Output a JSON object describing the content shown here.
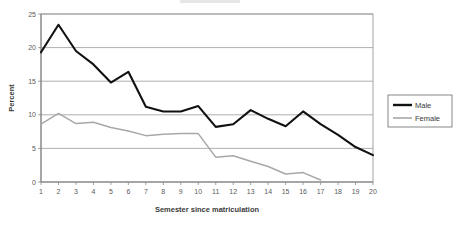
{
  "chart_data": {
    "type": "line",
    "title": "",
    "subtitle": "",
    "xlabel": "Semester since matriculation",
    "ylabel": "Percent",
    "x": [
      1,
      2,
      3,
      4,
      5,
      6,
      7,
      8,
      9,
      10,
      11,
      12,
      13,
      14,
      15,
      16,
      17,
      18,
      19,
      20
    ],
    "xticklabels": [
      "1",
      "2",
      "3",
      "4",
      "5",
      "6",
      "7",
      "8",
      "9",
      "10",
      "11",
      "12",
      "13",
      "14",
      "15",
      "16",
      "17",
      "18",
      "19",
      "20"
    ],
    "yticklabels": [
      "0",
      "5",
      "10",
      "15",
      "20",
      "25"
    ],
    "yticks": [
      0,
      5,
      10,
      15,
      20,
      25
    ],
    "ylim": [
      0,
      25
    ],
    "xlim": [
      1,
      20
    ],
    "grid": "horizontal",
    "legend_position": "right-outside",
    "series": [
      {
        "name": "Male",
        "color": "#111111",
        "values": [
          19.3,
          23.4,
          19.5,
          17.5,
          14.8,
          16.4,
          11.2,
          10.5,
          10.5,
          11.3,
          8.2,
          8.6,
          10.7,
          9.4,
          8.3,
          10.5,
          8.6,
          7.0,
          5.2,
          4.0
        ]
      },
      {
        "name": "Female",
        "color": "#a8a8a8",
        "values": [
          8.6,
          10.2,
          8.7,
          8.9,
          8.1,
          7.6,
          6.9,
          7.1,
          7.2,
          7.2,
          3.7,
          3.9,
          3.1,
          2.3,
          1.2,
          1.4,
          0.3,
          null,
          null,
          null
        ]
      }
    ]
  },
  "legend": {
    "items": [
      {
        "label": "Male",
        "color": "#111111"
      },
      {
        "label": "Female",
        "color": "#a8a8a8"
      }
    ]
  },
  "axes": {
    "y_title": "Percent",
    "x_title": "Semester since matriculation"
  }
}
